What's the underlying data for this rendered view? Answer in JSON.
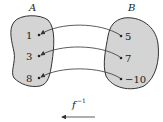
{
  "diagram": {
    "set_a_label": "A",
    "set_b_label": "B",
    "set_a_elements": [
      "1",
      "3",
      "8"
    ],
    "set_b_elements": [
      "5",
      "7",
      "−10"
    ],
    "mappings": [
      {
        "from": "5",
        "to": "1"
      },
      {
        "from": "7",
        "to": "3"
      },
      {
        "from": "−10",
        "to": "8"
      }
    ],
    "function_label": "f",
    "function_superscript": "−1",
    "direction": "B to A",
    "colors": {
      "blob_fill": "#d4d4d4",
      "stroke": "#333333"
    }
  }
}
